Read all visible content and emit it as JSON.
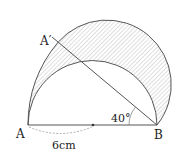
{
  "figure": {
    "type": "geometry",
    "labels": {
      "A": "A",
      "A_prime": "A′",
      "B": "B",
      "angle": "40°",
      "length": "6cm"
    },
    "values": {
      "angle_deg": 40,
      "segment_length_cm": 6
    },
    "colors": {
      "stroke": "#555555",
      "hatch": "#b8b8b8",
      "dashed": "#999999"
    }
  }
}
